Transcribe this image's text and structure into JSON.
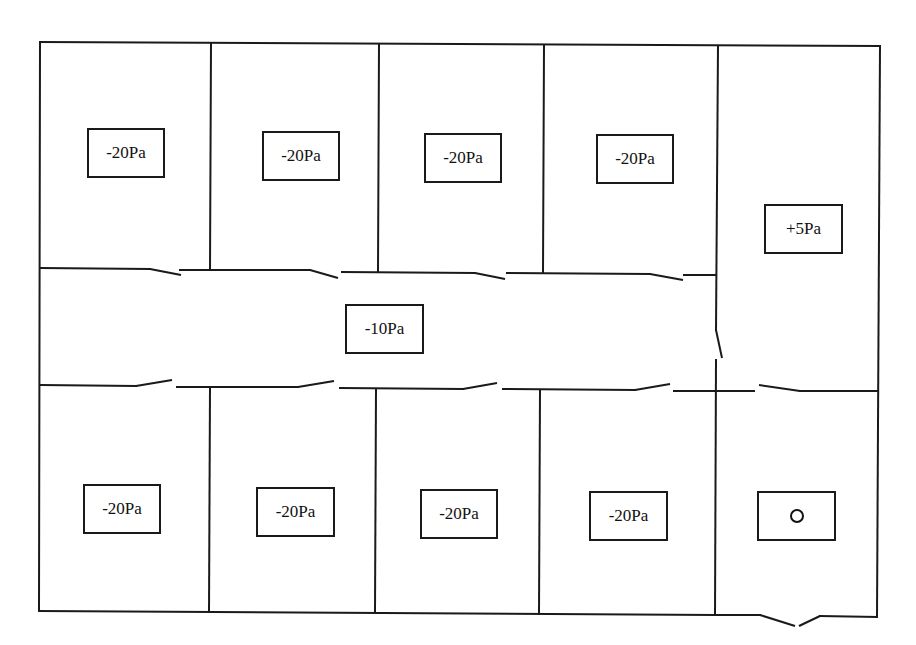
{
  "diagram": {
    "type": "pressure-zoning-floor-plan",
    "rooms_top_row": [
      {
        "id": "room-top-1",
        "pressure": "-20Pa"
      },
      {
        "id": "room-top-2",
        "pressure": "-20Pa"
      },
      {
        "id": "room-top-3",
        "pressure": "-20Pa"
      },
      {
        "id": "room-top-4",
        "pressure": "-20Pa"
      }
    ],
    "corridor": {
      "id": "corridor",
      "pressure": "-10Pa"
    },
    "anteroom": {
      "id": "room-right",
      "pressure": "+5Pa"
    },
    "rooms_bottom_row": [
      {
        "id": "room-bottom-1",
        "pressure": "-20Pa"
      },
      {
        "id": "room-bottom-2",
        "pressure": "-20Pa"
      },
      {
        "id": "room-bottom-3",
        "pressure": "-20Pa"
      },
      {
        "id": "room-bottom-4",
        "pressure": "-20Pa"
      }
    ],
    "entrance": {
      "id": "room-entrance",
      "pressure": "0"
    },
    "colors": {
      "line": "#1a1a1a",
      "background": "#ffffff"
    }
  }
}
